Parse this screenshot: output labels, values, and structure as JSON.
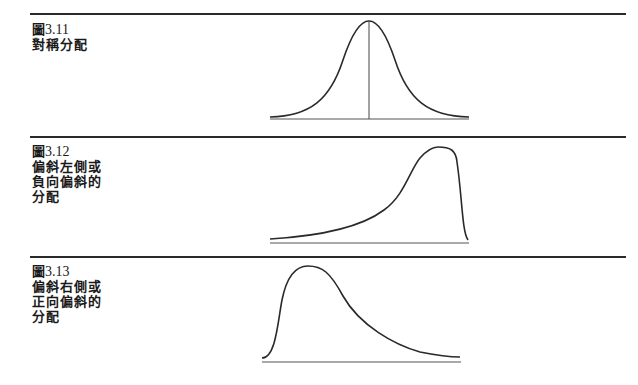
{
  "figures": [
    {
      "number_prefix": "圖",
      "number": "3.11",
      "caption_lines": [
        "對稱分配"
      ],
      "shape": "symmetric",
      "curve_path": "M270,117 C310,116 330,100 343,60 C352,33 360,21 369,21 C378,21 386,33 395,60 C408,100 428,116 469,117",
      "baseline": {
        "x1": 270,
        "x2": 469,
        "y": 119
      },
      "center_line": {
        "x": 369,
        "y1": 21,
        "y2": 119
      }
    },
    {
      "number_prefix": "圖",
      "number": "3.12",
      "caption_lines": [
        "偏斜左側或",
        "負向偏斜的",
        "分配"
      ],
      "shape": "negative-skew",
      "curve_path": "M270,239 C320,236 360,228 384,210 C404,196 410,170 420,158 C428,149 434,147 438,147 C450,147 456,150 457,162 C462,195 462,232 468,240",
      "baseline": {
        "x1": 270,
        "x2": 469,
        "y": 243
      }
    },
    {
      "number_prefix": "圖",
      "number": "3.13",
      "caption_lines": [
        "偏斜右側或",
        "正向偏斜的",
        "分配"
      ],
      "shape": "positive-skew",
      "curve_path": "M262,358 C276,358 278,320 282,300 C286,280 294,266 308,266 C322,266 330,272 343,296 C360,326 395,345 420,352 C440,356 450,357 460,357",
      "baseline": {
        "x1": 262,
        "x2": 461,
        "y": 362
      }
    }
  ],
  "rules_y": [
    14,
    137,
    257
  ],
  "colors": {
    "ink": "#2a2a2a",
    "background": "#ffffff"
  }
}
